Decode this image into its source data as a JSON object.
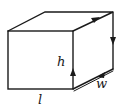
{
  "diagram": {
    "type": "cuboid",
    "labels": {
      "length": "l",
      "height": "h",
      "width": "w"
    },
    "loop_arrows": [
      {
        "edge": "right-face-front-vertical",
        "direction": "up"
      },
      {
        "edge": "right-face-top",
        "direction": "toward-back"
      },
      {
        "edge": "right-face-back-vertical",
        "direction": "down"
      },
      {
        "edge": "right-face-bottom",
        "direction": "toward-front"
      }
    ],
    "colors": {
      "line": "#1a1a1a",
      "background": "#ffffff"
    }
  }
}
